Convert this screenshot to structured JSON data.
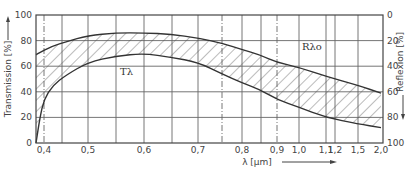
{
  "chart_data": {
    "type": "area",
    "title": "",
    "xlabel": "λ [µm]",
    "ylabel_left": "Transmission [%]",
    "ylabel_right": "Reflexion [%]",
    "x_scale": "nonlinear (wavelength, compressed above 1.0 µm)",
    "x_ticks": [
      "0,4",
      "0,5",
      "0,6",
      "0,7",
      "0,8",
      "0,9",
      "1,0",
      "1,1",
      "1,2",
      "1,5",
      "2,0"
    ],
    "y_left_ticks": [
      "0",
      "20",
      "40",
      "60",
      "80",
      "100"
    ],
    "y_right_ticks": [
      "0",
      "20",
      "40",
      "60",
      "80",
      "100"
    ],
    "ylim_left": [
      0,
      100
    ],
    "ylim_right": [
      100,
      0
    ],
    "grid": true,
    "reference_lines_dashdot": [
      "~0.4",
      "~0.75",
      "0.9"
    ],
    "annotations": [
      "Tλ",
      "Rλo"
    ],
    "series": [
      {
        "name": "upper boundary (Transmission scale)",
        "x": [
          0.38,
          0.42,
          0.45,
          0.5,
          0.55,
          0.6,
          0.65,
          0.7,
          0.75,
          0.8,
          0.85,
          0.9,
          1.0,
          1.1,
          1.5,
          2.0
        ],
        "values": [
          69,
          76,
          79,
          84,
          86,
          86,
          85,
          82,
          78,
          73,
          69,
          63,
          59,
          52,
          45,
          39
        ]
      },
      {
        "name": "lower boundary (Transmission scale)",
        "x": [
          0.38,
          0.39,
          0.4,
          0.42,
          0.45,
          0.5,
          0.55,
          0.6,
          0.65,
          0.7,
          0.75,
          0.8,
          0.85,
          0.9,
          1.0,
          1.1,
          1.5,
          2.0
        ],
        "values": [
          0,
          20,
          34,
          45,
          53,
          63,
          68,
          70,
          67,
          63,
          54,
          47,
          42,
          34,
          28,
          20,
          15,
          12
        ]
      }
    ],
    "shading": "hatched band between the two curves"
  },
  "labels": {
    "x_axis": "λ [µm]",
    "y_left": "Transmission [%]",
    "y_right": "Reflexion [%]",
    "t_label": "Tλ",
    "r_label": "Rλo"
  }
}
